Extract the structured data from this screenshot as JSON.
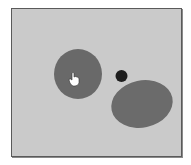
{
  "canvas": {
    "background": "#cacaca",
    "border_color": "#5a5a5a"
  },
  "shapes": [
    {
      "name": "left-circle",
      "type": "ellipse",
      "cx": 78,
      "cy": 74,
      "rx": 24,
      "ry": 25,
      "rotate": 0,
      "fill": "#696969"
    },
    {
      "name": "right-ellipse",
      "type": "ellipse",
      "cx": 142,
      "cy": 104,
      "rx": 31,
      "ry": 23.5,
      "rotate": -12,
      "fill": "#6b6b6b"
    },
    {
      "name": "small-dot",
      "type": "circle",
      "cx": 121.5,
      "cy": 76,
      "r": 6,
      "fill": "#1e1e1e"
    }
  ],
  "cursor": {
    "type": "hand-pointer",
    "x": 72,
    "y": 80
  }
}
